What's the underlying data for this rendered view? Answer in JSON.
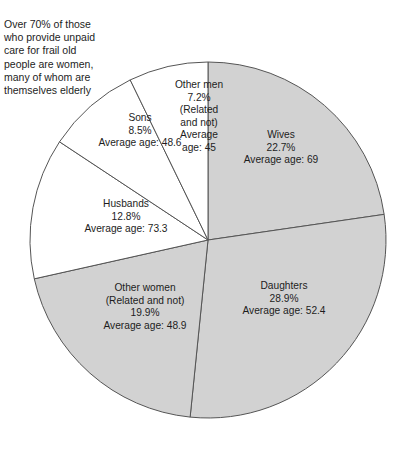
{
  "figure": {
    "caption": "Over 70% of those\nwho provide unpaid\ncare for frail old\npeople are women,\nmany of whom are\nthemselves elderly",
    "background_color": "#ffffff",
    "outline_color": "#555555",
    "shaded_color": "#d2d2d2",
    "unshaded_color": "#ffffff"
  },
  "chart_data": {
    "type": "pie",
    "title": "",
    "subtitle": "",
    "xlabel": "",
    "ylabel": "",
    "legend_position": "none",
    "grid": false,
    "start_angle_deg": 0,
    "direction": "clockwise",
    "center_px": [
      208,
      240
    ],
    "radius_px": 178,
    "categories": [
      "Wives",
      "Daughters",
      "Other women (Related and not)",
      "Husbands",
      "Sons",
      "Other men (Related and not)"
    ],
    "values": [
      22.7,
      28.9,
      19.9,
      12.8,
      8.5,
      7.2
    ],
    "value_unit": "%",
    "slices": [
      {
        "name": "Wives",
        "percent": "22.7%",
        "percent_value": 22.7,
        "average_age_label": "Average age: 69",
        "average_age": 69,
        "shaded": true,
        "label_lines": "Wives\n22.7%\nAverage age: 69"
      },
      {
        "name": "Daughters",
        "percent": "28.9%",
        "percent_value": 28.9,
        "average_age_label": "Average age: 52.4",
        "average_age": 52.4,
        "shaded": true,
        "label_lines": "Daughters\n28.9%\nAverage age: 52.4"
      },
      {
        "name": "Other women",
        "qualifier": "(Related and not)",
        "percent": "19.9%",
        "percent_value": 19.9,
        "average_age_label": "Average age: 48.9",
        "average_age": 48.9,
        "shaded": true,
        "label_lines": "Other women\n(Related and not)\n19.9%\nAverage age: 48.9"
      },
      {
        "name": "Husbands",
        "percent": "12.8%",
        "percent_value": 12.8,
        "average_age_label": "Average age: 73.3",
        "average_age": 73.3,
        "shaded": false,
        "label_lines": "Husbands\n12.8%\nAverage age: 73.3"
      },
      {
        "name": "Sons",
        "percent": "8.5%",
        "percent_value": 8.5,
        "average_age_label": "Average age: 48.6",
        "average_age": 48.6,
        "shaded": false,
        "label_lines": "Sons\n8.5%\nAverage age: 48.6"
      },
      {
        "name": "Other men",
        "qualifier": "(Related and not)",
        "percent": "7.2%",
        "percent_value": 7.2,
        "average_age_label": "Average age: 45",
        "average_age": 45,
        "shaded": false,
        "label_lines": "Other men\n7.2%\n(Related\nand not)\nAverage\nage: 45"
      }
    ]
  }
}
